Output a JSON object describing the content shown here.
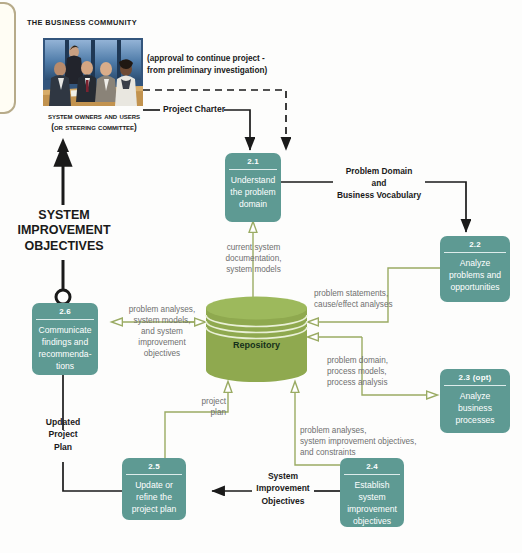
{
  "diagram": {
    "title_top": "THE BUSINESS COMMUNITY",
    "actor_caption": "System Owners and Users\n(or Steering Committee)",
    "big_label": "SYSTEM\nIMPROVEMENT\nOBJECTIVES",
    "photo_alt": "business-meeting-photo",
    "colors": {
      "process_fill": "#5e9a93",
      "repository_fill": "#8fa94f",
      "repository_top": "#9db95c",
      "flow_green": "#9aab63",
      "flow_black": "#1a1a1a",
      "text_gray": "#6f6f6f",
      "bleed_border": "#b7ab8a"
    },
    "processes": [
      {
        "id": "2.1",
        "num": "2.1",
        "label": "Understand\nthe problem\ndomain"
      },
      {
        "id": "2.2",
        "num": "2.2",
        "label": "Analyze\nproblems and\nopportunities"
      },
      {
        "id": "2.3",
        "num": "2.3 (opt)",
        "label": "Analyze\nbusiness\nprocesses"
      },
      {
        "id": "2.4",
        "num": "2.4",
        "label": "Establish\nsystem\nimprovement\nobjectives"
      },
      {
        "id": "2.5",
        "num": "2.5",
        "label": "Update or\nrefine the\nproject plan"
      },
      {
        "id": "2.6",
        "num": "2.6",
        "label": "Communicate\nfindings and\nrecommenda-\ntions"
      }
    ],
    "datastore": {
      "label": "Repository"
    },
    "black_flows": [
      {
        "id": "approval",
        "label": "(approval to continue project -\nfrom preliminary investigation)"
      },
      {
        "id": "project-charter",
        "label": "Project Charter"
      },
      {
        "id": "problem-domain",
        "label": "Problem Domain\nand\nBusiness Vocabulary"
      },
      {
        "id": "updated-project-plan",
        "label": "Updated\nProject\nPlan"
      },
      {
        "id": "system-improvement-objectives",
        "label": "System\nImprovement\nObjectives"
      }
    ],
    "green_flows": [
      {
        "id": "current-system-docs",
        "label": "current system\ndocumentation,\nsystem models"
      },
      {
        "id": "problem-statements",
        "label": "problem statements,\ncause/effect analyses"
      },
      {
        "id": "problem-domain-process",
        "label": "problem domain,\nprocess models,\nprocess analysis"
      },
      {
        "id": "problem-analyses-2-6",
        "label": "problem analyses,\nsystem models,\nand system\nimprovement\nobjectives"
      },
      {
        "id": "project-plan",
        "label": "project\nplan"
      },
      {
        "id": "problem-analyses-constraints",
        "label": "problem analyses,\nsystem improvement objectives,\nand constraints"
      }
    ]
  }
}
